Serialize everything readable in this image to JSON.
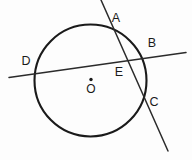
{
  "figure": {
    "kind": "circle-with-two-secants",
    "background_color": "#fdfdfd",
    "stroke_color": "#1a1a1a",
    "line_color": "#2b2b2b",
    "width": 192,
    "height": 160
  },
  "circle": {
    "cx": 90.5,
    "cy": 80.5,
    "r": 56,
    "stroke_width": 2.1
  },
  "center_point": {
    "dot_cx": 91,
    "dot_cy": 79.5,
    "dot_r": 1.7,
    "label": "O",
    "label_x": 91,
    "label_y": 90
  },
  "secants": [
    {
      "id": "secant-AC",
      "x1": 101,
      "y1": 0,
      "x2": 168,
      "y2": 151,
      "through_points": [
        "A",
        "E",
        "C"
      ]
    },
    {
      "id": "secant-DB",
      "x1": 9,
      "y1": 77.5,
      "x2": 186,
      "y2": 52.5,
      "through_points": [
        "D",
        "E",
        "B"
      ]
    }
  ],
  "labels": [
    {
      "id": "label-A",
      "text": "A",
      "x": 116,
      "y": 19
    },
    {
      "id": "label-B",
      "text": "B",
      "x": 152,
      "y": 44
    },
    {
      "id": "label-C",
      "text": "C",
      "x": 154,
      "y": 103
    },
    {
      "id": "label-D",
      "text": "D",
      "x": 26,
      "y": 62
    },
    {
      "id": "label-E",
      "text": "E",
      "x": 119,
      "y": 73
    }
  ],
  "label_text": {
    "A": "A",
    "B": "B",
    "C": "C",
    "D": "D",
    "E": "E",
    "O": "O"
  }
}
